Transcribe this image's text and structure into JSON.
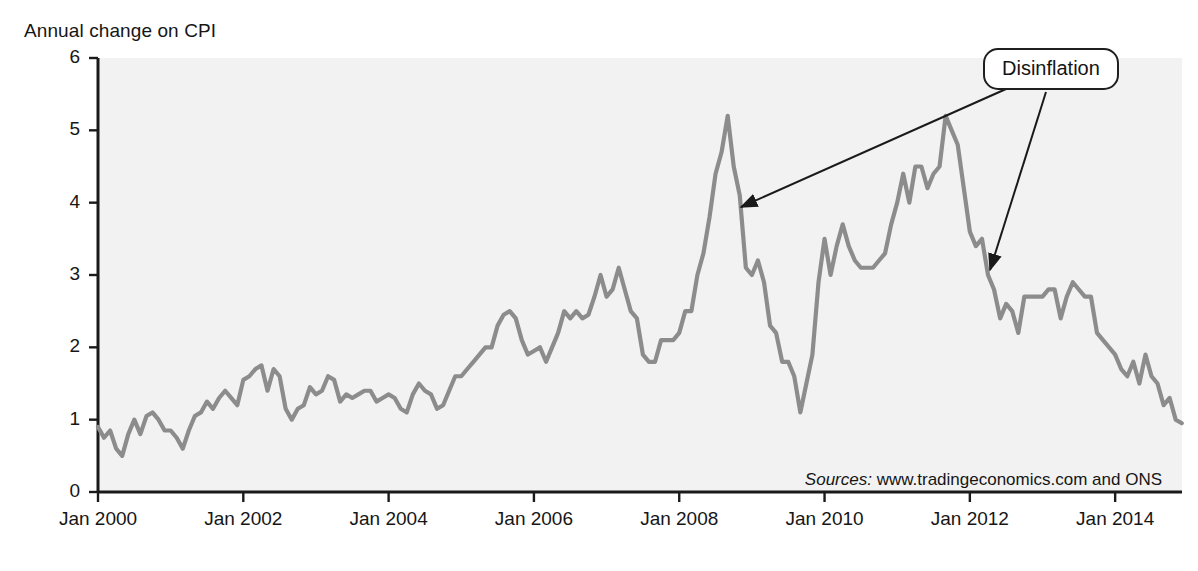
{
  "chart_data": {
    "type": "line",
    "title": "Annual change on CPI",
    "xlabel": "",
    "ylabel": "Annual change on CPI",
    "ylim": [
      0,
      6
    ],
    "yticks": [
      0,
      1,
      2,
      3,
      4,
      5,
      6
    ],
    "xtick_labels": [
      "Jan 2000",
      "Jan 2002",
      "Jan 2004",
      "Jan 2006",
      "Jan 2008",
      "Jan 2010",
      "Jan 2012",
      "Jan 2014"
    ],
    "xtick_values": [
      2000.0,
      2002.0,
      2004.0,
      2006.0,
      2008.0,
      2010.0,
      2012.0,
      2014.0
    ],
    "xlim": [
      2000.0,
      2014.92
    ],
    "grid": false,
    "legend": null,
    "series": [
      {
        "name": "UK CPI annual inflation rate",
        "color": "#8c8c8c",
        "x": [
          2000.0,
          2000.083,
          2000.167,
          2000.25,
          2000.333,
          2000.417,
          2000.5,
          2000.583,
          2000.667,
          2000.75,
          2000.833,
          2000.917,
          2001.0,
          2001.083,
          2001.167,
          2001.25,
          2001.333,
          2001.417,
          2001.5,
          2001.583,
          2001.667,
          2001.75,
          2001.833,
          2001.917,
          2002.0,
          2002.083,
          2002.167,
          2002.25,
          2002.333,
          2002.417,
          2002.5,
          2002.583,
          2002.667,
          2002.75,
          2002.833,
          2002.917,
          2003.0,
          2003.083,
          2003.167,
          2003.25,
          2003.333,
          2003.417,
          2003.5,
          2003.583,
          2003.667,
          2003.75,
          2003.833,
          2003.917,
          2004.0,
          2004.083,
          2004.167,
          2004.25,
          2004.333,
          2004.417,
          2004.5,
          2004.583,
          2004.667,
          2004.75,
          2004.833,
          2004.917,
          2005.0,
          2005.083,
          2005.167,
          2005.25,
          2005.333,
          2005.417,
          2005.5,
          2005.583,
          2005.667,
          2005.75,
          2005.833,
          2005.917,
          2006.0,
          2006.083,
          2006.167,
          2006.25,
          2006.333,
          2006.417,
          2006.5,
          2006.583,
          2006.667,
          2006.75,
          2006.833,
          2006.917,
          2007.0,
          2007.083,
          2007.167,
          2007.25,
          2007.333,
          2007.417,
          2007.5,
          2007.583,
          2007.667,
          2007.75,
          2007.833,
          2007.917,
          2008.0,
          2008.083,
          2008.167,
          2008.25,
          2008.333,
          2008.417,
          2008.5,
          2008.583,
          2008.667,
          2008.75,
          2008.833,
          2008.917,
          2009.0,
          2009.083,
          2009.167,
          2009.25,
          2009.333,
          2009.417,
          2009.5,
          2009.583,
          2009.667,
          2009.75,
          2009.833,
          2009.917,
          2010.0,
          2010.083,
          2010.167,
          2010.25,
          2010.333,
          2010.417,
          2010.5,
          2010.583,
          2010.667,
          2010.75,
          2010.833,
          2010.917,
          2011.0,
          2011.083,
          2011.167,
          2011.25,
          2011.333,
          2011.417,
          2011.5,
          2011.583,
          2011.667,
          2011.75,
          2011.833,
          2011.917,
          2012.0,
          2012.083,
          2012.167,
          2012.25,
          2012.333,
          2012.417,
          2012.5,
          2012.583,
          2012.667,
          2012.75,
          2012.833,
          2012.917,
          2013.0,
          2013.083,
          2013.167,
          2013.25,
          2013.333,
          2013.417,
          2013.5,
          2013.583,
          2013.667,
          2013.75,
          2013.833,
          2013.917,
          2014.0,
          2014.083,
          2014.167,
          2014.25,
          2014.333,
          2014.417,
          2014.5,
          2014.583,
          2014.667,
          2014.75,
          2014.833,
          2014.917
        ],
        "values": [
          0.9,
          0.75,
          0.85,
          0.6,
          0.5,
          0.8,
          1.0,
          0.8,
          1.05,
          1.1,
          1.0,
          0.85,
          0.85,
          0.75,
          0.6,
          0.85,
          1.05,
          1.1,
          1.25,
          1.15,
          1.3,
          1.4,
          1.3,
          1.2,
          1.55,
          1.6,
          1.7,
          1.75,
          1.4,
          1.7,
          1.6,
          1.15,
          1.0,
          1.15,
          1.2,
          1.45,
          1.35,
          1.4,
          1.6,
          1.55,
          1.25,
          1.35,
          1.3,
          1.35,
          1.4,
          1.4,
          1.25,
          1.3,
          1.35,
          1.3,
          1.15,
          1.1,
          1.35,
          1.5,
          1.4,
          1.35,
          1.15,
          1.2,
          1.4,
          1.6,
          1.6,
          1.7,
          1.8,
          1.9,
          2.0,
          2.0,
          2.3,
          2.45,
          2.5,
          2.4,
          2.1,
          1.9,
          1.95,
          2.0,
          1.8,
          2.0,
          2.2,
          2.5,
          2.4,
          2.5,
          2.4,
          2.45,
          2.7,
          3.0,
          2.7,
          2.8,
          3.1,
          2.8,
          2.5,
          2.4,
          1.9,
          1.8,
          1.8,
          2.1,
          2.1,
          2.1,
          2.2,
          2.5,
          2.5,
          3.0,
          3.3,
          3.8,
          4.4,
          4.7,
          5.2,
          4.5,
          4.1,
          3.1,
          3.0,
          3.2,
          2.9,
          2.3,
          2.2,
          1.8,
          1.8,
          1.6,
          1.1,
          1.5,
          1.9,
          2.9,
          3.5,
          3.0,
          3.4,
          3.7,
          3.4,
          3.2,
          3.1,
          3.1,
          3.1,
          3.2,
          3.3,
          3.7,
          4.0,
          4.4,
          4.0,
          4.5,
          4.5,
          4.2,
          4.4,
          4.5,
          5.2,
          5.0,
          4.8,
          4.2,
          3.6,
          3.4,
          3.5,
          3.0,
          2.8,
          2.4,
          2.6,
          2.5,
          2.2,
          2.7,
          2.7,
          2.7,
          2.7,
          2.8,
          2.8,
          2.4,
          2.7,
          2.9,
          2.8,
          2.7,
          2.7,
          2.2,
          2.1,
          2.0,
          1.9,
          1.7,
          1.6,
          1.8,
          1.5,
          1.9,
          1.6,
          1.5,
          1.2,
          1.3,
          1.0,
          0.95
        ]
      }
    ],
    "annotations": [
      {
        "label": "Disinflation",
        "arrows": [
          {
            "from_x": 1006,
            "from_y": 89,
            "to_x": 741,
            "to_y": 207
          },
          {
            "from_x": 1046,
            "from_y": 92,
            "to_x": 990,
            "to_y": 270
          }
        ]
      }
    ],
    "source_prefix": "Sources:",
    "source_text": "www.tradingeconomics.com and ONS"
  },
  "axis": {
    "y_title": "Annual change on CPI",
    "y_labels": [
      "6",
      "5",
      "4",
      "3",
      "2",
      "1",
      "0"
    ],
    "x_labels": [
      "Jan 2000",
      "Jan 2002",
      "Jan 2004",
      "Jan 2006",
      "Jan 2008",
      "Jan 2010",
      "Jan 2012",
      "Jan 2014"
    ]
  },
  "annotation": {
    "disinflation_label": "Disinflation"
  },
  "source": {
    "prefix": "Sources:",
    "text": " www.tradingeconomics.com and ONS"
  },
  "colors": {
    "line": "#8c8c8c",
    "plot_background": "#f2f2f2",
    "axis": "#1a1a1a",
    "annotation_border": "#1f1f1f"
  }
}
